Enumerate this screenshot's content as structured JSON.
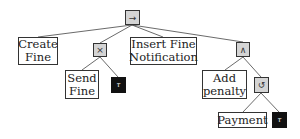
{
  "diagram": {
    "type": "process-tree",
    "root": {
      "id": "seq",
      "operator": "sequence",
      "symbol": "→",
      "children": [
        "create-fine",
        "xor",
        "insert-fine-notification",
        "and"
      ]
    },
    "nodes": {
      "seq": {
        "kind": "operator",
        "operator": "sequence",
        "symbol": "→"
      },
      "create-fine": {
        "kind": "activity",
        "label": "Create\nFine"
      },
      "xor": {
        "kind": "operator",
        "operator": "exclusive-choice",
        "symbol": "×"
      },
      "send-fine": {
        "kind": "activity",
        "label": "Send\nFine"
      },
      "tau1": {
        "kind": "silent",
        "symbol": "τ"
      },
      "insert-fine-notification": {
        "kind": "activity",
        "label": "Insert Fine\nNotification"
      },
      "and": {
        "kind": "operator",
        "operator": "parallel",
        "symbol": "∧"
      },
      "add-penalty": {
        "kind": "activity",
        "label": "Add\npenalty"
      },
      "loop": {
        "kind": "operator",
        "operator": "loop",
        "symbol": "↺"
      },
      "payment": {
        "kind": "activity",
        "label": "Payment"
      },
      "tau2": {
        "kind": "silent",
        "symbol": "τ"
      }
    },
    "edges": [
      [
        "seq",
        "create-fine"
      ],
      [
        "seq",
        "xor"
      ],
      [
        "seq",
        "insert-fine-notification"
      ],
      [
        "seq",
        "and"
      ],
      [
        "xor",
        "send-fine"
      ],
      [
        "xor",
        "tau1"
      ],
      [
        "and",
        "add-penalty"
      ],
      [
        "and",
        "loop"
      ],
      [
        "loop",
        "payment"
      ],
      [
        "loop",
        "tau2"
      ]
    ],
    "colors": {
      "operator_fill": "#d4d4d4",
      "activity_fill": "#ffffff",
      "silent_fill": "#111111",
      "border": "#333333",
      "edge": "#444444"
    }
  }
}
